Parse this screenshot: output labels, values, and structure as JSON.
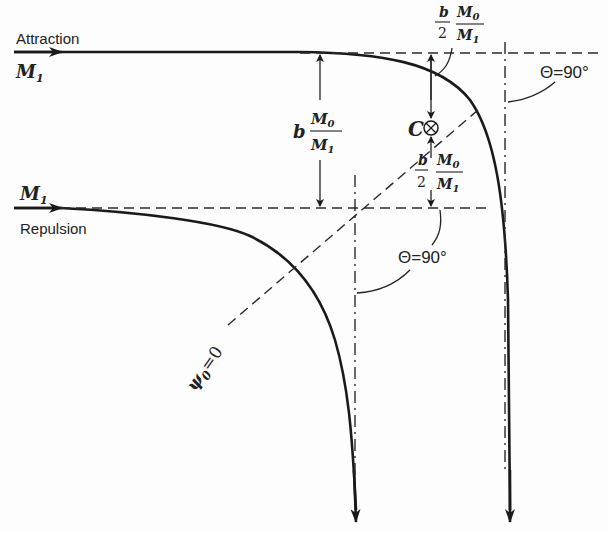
{
  "diagram": {
    "type": "scattering-trajectories",
    "labels": {
      "attraction": "Attraction",
      "repulsion": "Repulsion",
      "particle_top": "M",
      "particle_top_sub": "1",
      "particle_bottom": "M",
      "particle_bottom_sub": "1",
      "center": "C",
      "center_symbol": "⊗",
      "theta_right": "Θ=90°",
      "theta_mid": "Θ=90°",
      "psi": "ψ",
      "psi_sub": "0",
      "psi_eq": "=0",
      "impact_b": "b",
      "impact_num": "M",
      "impact_num_sub": "0",
      "impact_den": "M",
      "impact_den_sub": "1",
      "half_top_num": "b",
      "half_top_den": "2",
      "half_top_mnum": "M",
      "half_top_mnum_sub": "0",
      "half_top_mden": "M",
      "half_top_mden_sub": "1",
      "half_bot_num": "b",
      "half_bot_den": "2",
      "half_bot_mnum": "M",
      "half_bot_mnum_sub": "0",
      "half_bot_mden": "M",
      "half_bot_mden_sub": "1"
    },
    "colors": {
      "line": "#1a1a1a",
      "background": "#fdfdfd"
    }
  }
}
